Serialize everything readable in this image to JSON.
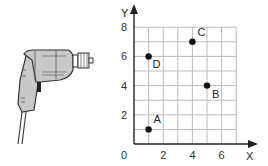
{
  "chart_data": {
    "type": "scatter",
    "title": "",
    "xlabel": "X",
    "ylabel": "Y",
    "xlim": [
      0,
      7
    ],
    "ylim": [
      0,
      8
    ],
    "grid": true,
    "x_ticks": [
      "0",
      "2",
      "4",
      "6"
    ],
    "y_ticks": [
      "2",
      "4",
      "6",
      "8"
    ],
    "points": [
      {
        "label": "A",
        "x": 1,
        "y": 1
      },
      {
        "label": "B",
        "x": 5,
        "y": 4
      },
      {
        "label": "C",
        "x": 4,
        "y": 7
      },
      {
        "label": "D",
        "x": 1,
        "y": 6
      }
    ]
  },
  "illustration": {
    "name": "electric drill"
  }
}
